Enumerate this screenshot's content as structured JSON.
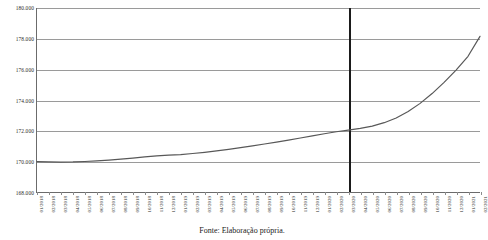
{
  "caption": "Fonte: Elaboração própria.",
  "chart_data": {
    "type": "line",
    "title": "",
    "subtitle": "",
    "xlabel": "",
    "ylabel": "",
    "grid": true,
    "legend": "none",
    "ylim": [
      168000,
      180000
    ],
    "yticks": [
      168000,
      170000,
      172000,
      174000,
      176000,
      178000,
      180000
    ],
    "ytick_labels": [
      "168.000",
      "170.000",
      "172.000",
      "174.000",
      "176.000",
      "178.000",
      "180.000"
    ],
    "categories": [
      "01/2018",
      "02/2018",
      "03/2018",
      "04/2018",
      "05/2018",
      "06/2018",
      "07/2018",
      "08/2018",
      "09/2018",
      "10/2018",
      "11/2018",
      "12/2018",
      "01/2019",
      "02/2019",
      "03/2019",
      "04/2019",
      "05/2019",
      "06/2019",
      "07/2019",
      "08/2019",
      "09/2019",
      "10/2019",
      "11/2019",
      "12/2019",
      "01/2020",
      "02/2020",
      "03/2020",
      "04/2020",
      "05/2020",
      "06/2020",
      "07/2020",
      "08/2020",
      "09/2020",
      "10/2020",
      "11/2020",
      "12/2020",
      "01/2021",
      "02/2021"
    ],
    "x_tick_label_rotation": -90,
    "series": [
      {
        "name": "Série",
        "color": "#585858",
        "values": [
          169980,
          169960,
          169950,
          169960,
          169990,
          170030,
          170080,
          170140,
          170210,
          170290,
          170360,
          170400,
          170440,
          170510,
          170590,
          170680,
          170780,
          170890,
          171010,
          171130,
          171250,
          171380,
          171520,
          171660,
          171800,
          171930,
          172040,
          172150,
          172300,
          172520,
          172830,
          173250,
          173780,
          174420,
          175150,
          175950,
          176850,
          178150
        ]
      }
    ],
    "annotations": [
      {
        "type": "vline",
        "name": "marker-line",
        "category": "03/2020",
        "color": "#1b1b1b",
        "width_px": 2
      }
    ]
  }
}
